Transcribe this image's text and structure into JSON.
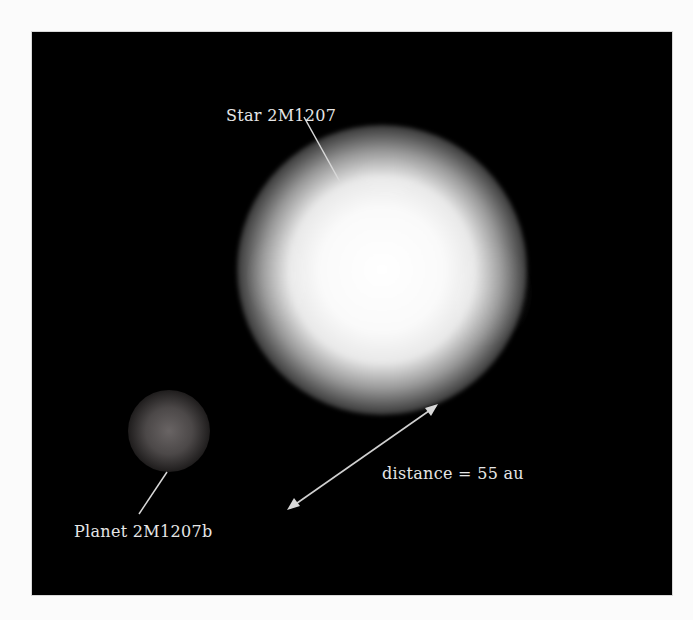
{
  "figure": {
    "labels": {
      "star": "Star 2M1207",
      "planet": "Planet 2M1207b",
      "distance": "distance = 55 au"
    },
    "colors": {
      "background": "#000000",
      "page": "#fbfbfb",
      "text": "#e6e6e6",
      "line": "#d8d8d8"
    },
    "icons": {
      "star_pointer": "leader-line",
      "planet_pointer": "leader-line",
      "distance_arrow": "double-headed-arrow"
    }
  }
}
